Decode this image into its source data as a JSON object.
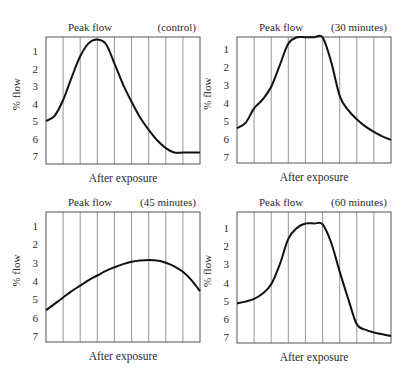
{
  "chart_data": [
    {
      "type": "line",
      "panel": "top-left",
      "title": "Peak flow",
      "subtitle": "(control)",
      "xlabel": "After exposure",
      "ylabel": "% flow",
      "yticks": [
        "1",
        "2",
        "3",
        "4",
        "5",
        "6",
        "7"
      ],
      "y_inverted": true,
      "grid": "vertical lines, 9 columns",
      "x": [
        0,
        0.5,
        1,
        1.5,
        2,
        2.5,
        3,
        3.5,
        4,
        4.5,
        5,
        5.5,
        6,
        6.5,
        7,
        7.5,
        8,
        8.5,
        9
      ],
      "values": [
        5.0,
        4.7,
        3.8,
        2.5,
        1.3,
        0.55,
        0.35,
        0.6,
        1.7,
        2.9,
        3.9,
        4.8,
        5.5,
        6.1,
        6.55,
        6.8,
        6.8,
        6.8,
        6.8
      ],
      "box": {
        "x": 46,
        "y": 37,
        "w": 154,
        "h": 127
      },
      "y1": 51,
      "y7": 156
    },
    {
      "type": "line",
      "panel": "top-right",
      "title": "Peak flow",
      "subtitle": "(30 minutes)",
      "xlabel": "After exposure",
      "ylabel": "% flow",
      "yticks": [
        "1",
        "2",
        "3",
        "4",
        "5",
        "6",
        "7"
      ],
      "y_inverted": true,
      "grid": "vertical lines, 9 columns",
      "x": [
        0,
        0.5,
        1,
        1.5,
        2,
        2.5,
        3,
        3.5,
        4,
        4.5,
        5,
        5.5,
        6,
        6.5,
        7,
        7.5,
        8,
        8.5,
        9
      ],
      "values": [
        5.4,
        5.1,
        4.3,
        3.8,
        3.1,
        1.9,
        0.7,
        0.35,
        0.35,
        0.35,
        0.35,
        1.7,
        3.6,
        4.4,
        4.9,
        5.3,
        5.6,
        5.85,
        6.05
      ],
      "box": {
        "x": 237,
        "y": 37,
        "w": 154,
        "h": 126
      },
      "y1": 49,
      "y7": 157
    },
    {
      "type": "line",
      "panel": "bottom-left",
      "title": "Peak flow",
      "subtitle": "(45 minutes)",
      "xlabel": "After exposure",
      "ylabel": "% flow",
      "yticks": [
        "1",
        "2",
        "3",
        "4",
        "5",
        "6",
        "7"
      ],
      "y_inverted": true,
      "grid": "vertical lines, 9 columns",
      "x": [
        0,
        0.5,
        1,
        1.5,
        2,
        2.5,
        3,
        3.5,
        4,
        4.5,
        5,
        5.5,
        6,
        6.5,
        7,
        7.5,
        8,
        8.5,
        9
      ],
      "values": [
        5.6,
        5.25,
        4.9,
        4.55,
        4.25,
        3.95,
        3.7,
        3.45,
        3.25,
        3.08,
        2.95,
        2.88,
        2.85,
        2.88,
        3.0,
        3.2,
        3.5,
        3.95,
        4.55
      ],
      "box": {
        "x": 46,
        "y": 212,
        "w": 154,
        "h": 130
      },
      "y1": 226,
      "y7": 336
    },
    {
      "type": "line",
      "panel": "bottom-right",
      "title": "Peak flow",
      "subtitle": "(60 minutes)",
      "xlabel": "After exposure",
      "ylabel": "% flow",
      "yticks": [
        "1",
        "2",
        "3",
        "4",
        "5",
        "6",
        "7"
      ],
      "y_inverted": true,
      "grid": "vertical lines, 9 columns",
      "x": [
        0,
        0.5,
        1,
        1.5,
        2,
        2.5,
        3,
        3.5,
        4,
        4.5,
        5,
        5.5,
        6,
        6.5,
        7,
        7.5,
        8,
        8.5,
        9
      ],
      "values": [
        5.15,
        5.05,
        4.9,
        4.6,
        4.1,
        3.0,
        1.6,
        1.0,
        0.75,
        0.75,
        0.8,
        1.8,
        3.4,
        4.9,
        6.3,
        6.6,
        6.75,
        6.85,
        6.95
      ],
      "box": {
        "x": 237,
        "y": 212,
        "w": 154,
        "h": 131
      },
      "y1": 228,
      "y7": 337
    }
  ]
}
